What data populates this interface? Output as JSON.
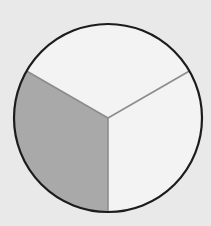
{
  "diagram": {
    "type": "fraction-circle",
    "parts_total": 3,
    "parts_shaded": 1,
    "fraction_shaded": "1/3",
    "center": [
      108,
      118
    ],
    "radius": 94,
    "divider_angles_deg": [
      90,
      210,
      330
    ],
    "shaded_sector": {
      "start_deg": 90,
      "end_deg": 210
    },
    "colors": {
      "background": "#e9e9e9",
      "fill": "#f3f3f3",
      "shaded": "#a9a9a9",
      "outline": "#1c1c1c",
      "divider": "#8c8c8c"
    }
  }
}
